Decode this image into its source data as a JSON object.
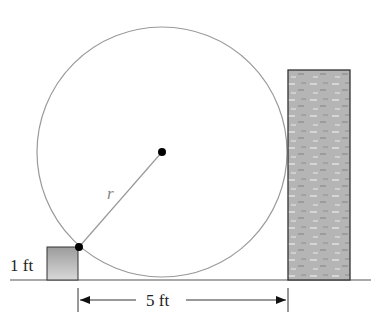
{
  "diagram": {
    "labels": {
      "box_height": "1 ft",
      "distance": "5 ft",
      "radius": "r"
    },
    "colors": {
      "circle_stroke": "#9a9a9a",
      "ground": "#555555",
      "box_fill_top": "#e4e4e4",
      "box_fill_bottom": "#a8a8a8",
      "wall_fill": "#b4b4b4",
      "wall_stroke": "#333333",
      "point": "#000000"
    }
  }
}
